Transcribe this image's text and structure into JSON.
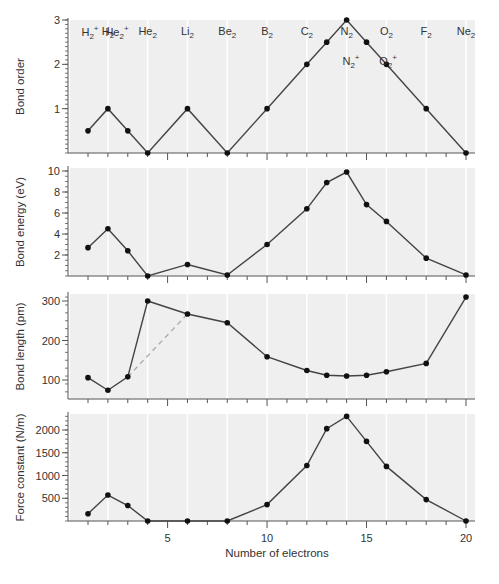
{
  "chart_data": [
    {
      "type": "line",
      "title": "",
      "ylabel": "Bond order",
      "xlabel": "",
      "xlim": [
        0,
        20.5
      ],
      "ylim": [
        0,
        3
      ],
      "yticks": [
        1,
        2,
        3
      ],
      "ytick_labels": [
        "1",
        "2",
        "3"
      ],
      "grid": true,
      "x": [
        1,
        2,
        3,
        4,
        6,
        8,
        10,
        12,
        13,
        14,
        15,
        16,
        18,
        20
      ],
      "values": [
        0.5,
        1,
        0.5,
        0,
        1,
        0,
        1,
        2,
        2.5,
        3,
        2.5,
        2,
        1,
        0
      ],
      "annotations": [
        {
          "text": "H2+",
          "base": "H",
          "sub": "2",
          "sup": "+",
          "x": 1
        },
        {
          "text": "He2+",
          "base": "He",
          "sub": "2",
          "sup": "+",
          "x": 3
        },
        {
          "text": "N2+",
          "base": "N",
          "sub": "2",
          "sup": "+",
          "x": 13
        },
        {
          "text": "O2+",
          "base": "O",
          "sub": "2",
          "sup": "+",
          "x": 15
        }
      ],
      "top_labels": [
        {
          "text": "H2",
          "base": "H",
          "sub": "2",
          "x": 2
        },
        {
          "text": "He2",
          "base": "He",
          "sub": "2",
          "x": 4
        },
        {
          "text": "Li2",
          "base": "Li",
          "sub": "2",
          "x": 6
        },
        {
          "text": "Be2",
          "base": "Be",
          "sub": "2",
          "x": 8
        },
        {
          "text": "B2",
          "base": "B",
          "sub": "2",
          "x": 10
        },
        {
          "text": "C2",
          "base": "C",
          "sub": "2",
          "x": 12
        },
        {
          "text": "N2",
          "base": "N",
          "sub": "2",
          "x": 14
        },
        {
          "text": "O2",
          "base": "O",
          "sub": "2",
          "x": 16
        },
        {
          "text": "F2",
          "base": "F",
          "sub": "2",
          "x": 18
        },
        {
          "text": "Ne2",
          "base": "Ne",
          "sub": "2",
          "x": 20
        }
      ]
    },
    {
      "type": "line",
      "ylabel": "Bond energy (eV)",
      "xlabel": "",
      "xlim": [
        0,
        20.5
      ],
      "ylim": [
        0,
        10
      ],
      "yticks": [
        2,
        4,
        6,
        8,
        10
      ],
      "ytick_labels": [
        "2",
        "4",
        "6",
        "8",
        "10"
      ],
      "grid": true,
      "x": [
        1,
        2,
        3,
        4,
        6,
        8,
        10,
        12,
        13,
        14,
        15,
        16,
        18,
        20
      ],
      "values": [
        2.7,
        4.5,
        2.4,
        0.0,
        1.1,
        0.1,
        3.0,
        6.4,
        8.9,
        9.9,
        6.8,
        5.2,
        1.7,
        0.1
      ]
    },
    {
      "type": "line",
      "ylabel": "Bond length (pm)",
      "xlabel": "",
      "xlim": [
        0,
        20.5
      ],
      "ylim": [
        50,
        320
      ],
      "yticks": [
        100,
        200,
        300
      ],
      "ytick_labels": [
        "100",
        "200",
        "300"
      ],
      "grid": true,
      "x": [
        1,
        2,
        3,
        4,
        6,
        8,
        10,
        12,
        13,
        14,
        15,
        16,
        18,
        20
      ],
      "values": [
        106,
        74,
        108,
        300,
        267,
        245,
        159,
        124,
        112,
        110,
        112,
        121,
        142,
        310
      ],
      "dashed_connector": {
        "from_x": 3,
        "to_x": 6
      }
    },
    {
      "type": "line",
      "ylabel": "Force constant (N/m)",
      "xlabel": "Number of electrons",
      "xlim": [
        0,
        20.5
      ],
      "ylim": [
        0,
        2350
      ],
      "yticks": [
        500,
        1000,
        1500,
        2000
      ],
      "ytick_labels": [
        "500",
        "1000",
        "1500",
        "2000"
      ],
      "xticks": [
        5,
        10,
        15,
        20
      ],
      "xtick_labels": [
        "5",
        "10",
        "15",
        "20"
      ],
      "grid": true,
      "x": [
        1,
        2,
        3,
        4,
        6,
        8,
        10,
        12,
        13,
        14,
        15,
        16,
        18,
        20
      ],
      "values": [
        160,
        570,
        340,
        0,
        0,
        0,
        360,
        1220,
        2030,
        2300,
        1750,
        1200,
        470,
        0
      ]
    }
  ]
}
